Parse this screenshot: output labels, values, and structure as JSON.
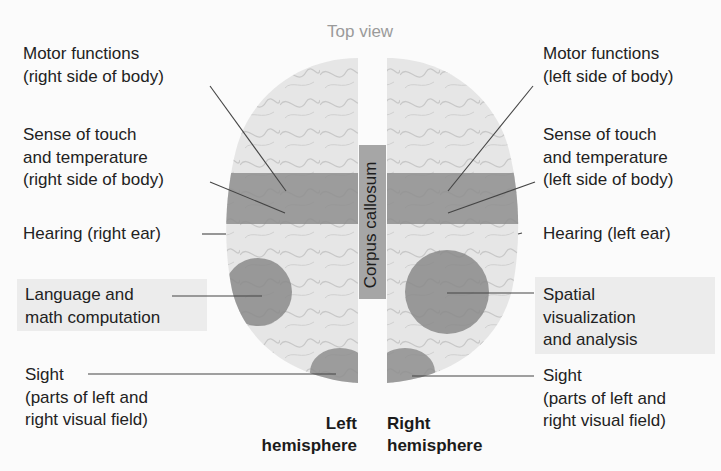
{
  "figure": {
    "title": "Top view",
    "corpus_callosum": "Corpus callosum",
    "hemispheres": {
      "left": "Left\nhemisphere",
      "right": "Right\nhemisphere"
    },
    "left_labels": {
      "motor": "Motor functions\n(right side of body)",
      "touch": "Sense of touch\nand temperature\n(right side of body)",
      "hearing": "Hearing (right ear)",
      "language": "Language and\nmath computation",
      "sight": "Sight\n(parts of left and\nright visual field)"
    },
    "right_labels": {
      "motor": "Motor functions\n(left side of body)",
      "touch": "Sense of touch\nand temperature\n(left side of body)",
      "hearing": "Hearing (left ear)",
      "spatial": "Spatial\nvisualization\nand analysis",
      "sight": "Sight\n(parts of left and\nright visual field)"
    },
    "colors": {
      "brain": "#e4e4e4",
      "region": "#8f8f8f",
      "callosum": "#a8a8a8",
      "highlight_box": "#ececec",
      "leader_line": "#444444"
    }
  }
}
